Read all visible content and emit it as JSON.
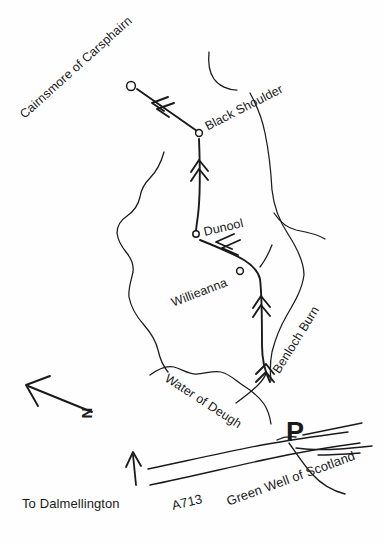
{
  "map": {
    "title": "Cairnsmore of Carsphairn walking route map",
    "background_color": "#fefefe",
    "ink_color": "#1a1a1a",
    "summits": [
      {
        "name": "Cairnsmore of Carsphairn",
        "marker": "circle",
        "x": 130,
        "y": 86,
        "label_x": 22,
        "label_y": 110,
        "rotation": -42
      },
      {
        "name": "Black Shoulder",
        "marker": "circle",
        "x": 199,
        "y": 133,
        "label_x": 206,
        "label_y": 121,
        "rotation": -27
      },
      {
        "name": "Dunool",
        "marker": "circle",
        "x": 196,
        "y": 234,
        "label_x": 204,
        "label_y": 226,
        "rotation": -13
      },
      {
        "name": "Willieanna",
        "marker": "circle",
        "x": 239,
        "y": 271,
        "label_x": 172,
        "label_y": 297,
        "rotation": -21
      }
    ],
    "waters": [
      {
        "name": "Benloch Burn",
        "label_x": 276,
        "label_y": 366,
        "rotation": -58
      },
      {
        "name": "Water of Deugh",
        "label_x": 166,
        "label_y": 371,
        "rotation": 33
      }
    ],
    "roads": [
      {
        "name": "A713",
        "label_x": 172,
        "label_y": 499,
        "rotation": -13
      },
      {
        "name": "To Dalmellington",
        "label_x": 22,
        "label_y": 497,
        "rotation": 0
      },
      {
        "name": "Green Well of Scotland",
        "label_x": 227,
        "label_y": 495,
        "rotation": -20
      }
    ],
    "markers": [
      {
        "name": "parking",
        "label": "P",
        "label_x": 286,
        "label_y": 419,
        "rotation": 0
      }
    ],
    "compass": {
      "label": "N",
      "label_x": 86,
      "label_y": 411,
      "rotation": -90,
      "arrow_from": [
        95,
        412
      ],
      "arrow_to": [
        27,
        385
      ]
    },
    "icons": {
      "summit": "circle-marker-icon",
      "parking": "parking-p-icon",
      "north": "north-arrow-icon",
      "route": "route-chevron-icon",
      "access": "access-arrow-icon"
    }
  }
}
